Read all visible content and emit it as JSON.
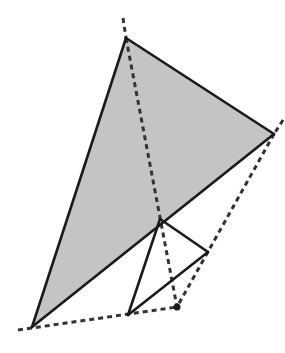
{
  "diagram": {
    "fill_color": "#c4c4c4",
    "stroke_color": "#1a1a1a",
    "dash_color": "#333333",
    "points": {
      "A": [
        126,
        38
      ],
      "B": [
        274,
        134
      ],
      "C": [
        32,
        327
      ],
      "P": [
        160,
        219
      ],
      "Q": [
        208,
        252
      ],
      "R": [
        128,
        315
      ],
      "D": [
        177,
        307
      ]
    },
    "shaded_triangle": [
      "A",
      "B",
      "C"
    ],
    "solid_segments": [
      [
        "A",
        "B"
      ],
      [
        "B",
        "C"
      ],
      [
        "C",
        "A"
      ],
      [
        "P",
        "Q"
      ],
      [
        "Q",
        "R"
      ],
      [
        "R",
        "P"
      ]
    ],
    "dashed_segments": [
      [
        [
          123,
          18
        ],
        [
          126,
          38
        ]
      ],
      [
        [
          126,
          38
        ],
        [
          177,
          307
        ]
      ],
      [
        [
          283,
          120
        ],
        [
          274,
          134
        ]
      ],
      [
        [
          274,
          134
        ],
        [
          177,
          307
        ]
      ],
      [
        [
          18,
          330
        ],
        [
          177,
          307
        ]
      ]
    ],
    "dot": "D"
  }
}
